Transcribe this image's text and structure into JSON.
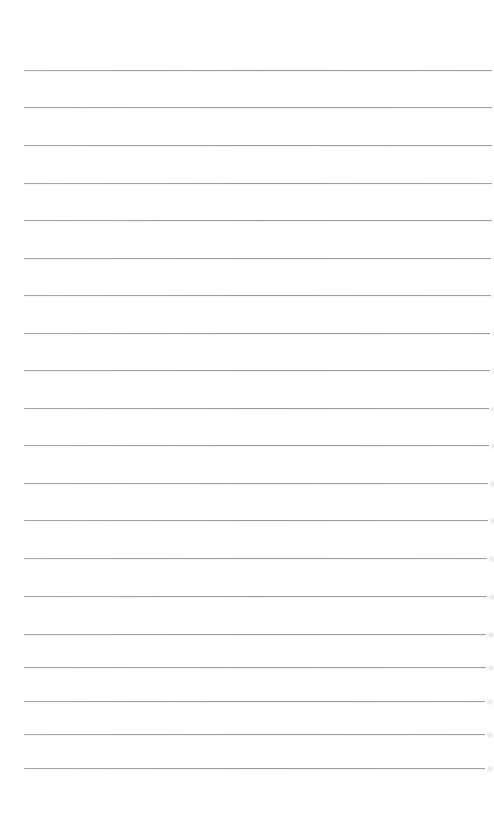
{
  "page": {
    "type": "blank lined paper",
    "background_color": "#ffffff",
    "line_color": "#9a9a9a",
    "line_count": 20,
    "lines": [
      {
        "y": 70,
        "x_end": 492
      },
      {
        "y": 107,
        "x_end": 492
      },
      {
        "y": 145,
        "x_end": 492
      },
      {
        "y": 183,
        "x_end": 492
      },
      {
        "y": 220,
        "x_end": 492
      },
      {
        "y": 258,
        "x_end": 491
      },
      {
        "y": 295,
        "x_end": 491
      },
      {
        "y": 333,
        "x_end": 490
      },
      {
        "y": 370,
        "x_end": 490
      },
      {
        "y": 408,
        "x_end": 489
      },
      {
        "y": 445,
        "x_end": 489
      },
      {
        "y": 483,
        "x_end": 488
      },
      {
        "y": 520,
        "x_end": 488
      },
      {
        "y": 558,
        "x_end": 487
      },
      {
        "y": 596,
        "x_end": 487
      },
      {
        "y": 634,
        "x_end": 486
      },
      {
        "y": 667,
        "x_end": 486
      },
      {
        "y": 701,
        "x_end": 485
      },
      {
        "y": 734,
        "x_end": 485
      },
      {
        "y": 768,
        "x_end": 485
      }
    ]
  }
}
